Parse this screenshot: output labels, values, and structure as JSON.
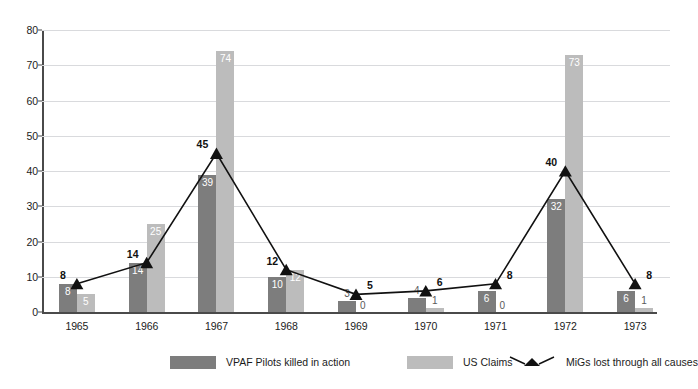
{
  "chart_data": {
    "type": "bar",
    "title": "",
    "subtitle": "",
    "xlabel": "",
    "ylabel": "",
    "categories": [
      "1965",
      "1966",
      "1967",
      "1968",
      "1969",
      "1970",
      "1971",
      "1972",
      "1973"
    ],
    "ylim": [
      0,
      80
    ],
    "ytick_labels": [
      "0",
      "10",
      "20",
      "30",
      "40",
      "50",
      "60",
      "70",
      "80"
    ],
    "ytick_values": [
      0,
      10,
      20,
      30,
      40,
      50,
      60,
      70,
      80
    ],
    "grid": true,
    "legend_position": "bottom",
    "series": [
      {
        "name": "VPAF Pilots killed in action",
        "type": "bar",
        "color": "#7d7d7d",
        "values": [
          8,
          14,
          39,
          10,
          3,
          4,
          6,
          32,
          6
        ],
        "labels": [
          "8",
          "14",
          "39",
          "10",
          "3",
          "4",
          "6",
          "32",
          "6"
        ]
      },
      {
        "name": "US Claims",
        "type": "bar",
        "color": "#bcbcbc",
        "values": [
          5,
          25,
          74,
          12,
          0,
          1,
          0,
          73,
          1
        ],
        "labels": [
          "5",
          "25",
          "74",
          "12",
          "0",
          "1",
          "0",
          "73",
          "1"
        ]
      },
      {
        "name": "MiGs lost through all causes",
        "type": "line",
        "color": "#111111",
        "marker": "triangle",
        "values": [
          8,
          14,
          45,
          12,
          5,
          6,
          8,
          40,
          8
        ],
        "labels": [
          "8",
          "14",
          "45",
          "12",
          "5",
          "6",
          "8",
          "40",
          "8"
        ]
      }
    ]
  },
  "legend": {
    "items": [
      {
        "label": "VPAF Pilots killed in action",
        "swatch": "dark-square-swatch"
      },
      {
        "label": "US Claims",
        "swatch": "light-square-swatch"
      },
      {
        "label": "MiGs lost through all causes",
        "swatch": "triangle-line-marker"
      }
    ]
  }
}
